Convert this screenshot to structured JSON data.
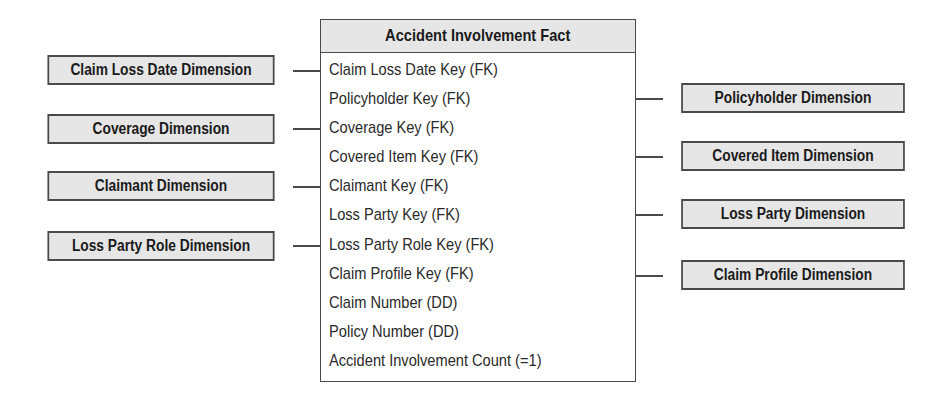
{
  "fact_table": {
    "title": "Accident Involvement Fact",
    "columns": [
      "Claim Loss Date Key (FK)",
      "Policyholder Key (FK)",
      "Coverage Key (FK)",
      "Covered Item Key (FK)",
      "Claimant Key (FK)",
      "Loss Party Key (FK)",
      "Loss Party Role Key (FK)",
      "Claim Profile Key (FK)",
      "Claim Number (DD)",
      "Policy Number (DD)",
      "Accident Involvement Count (=1)"
    ]
  },
  "left_dimensions": [
    {
      "label": "Claim Loss Date Dimension",
      "links_to": "Claim Loss Date Key (FK)"
    },
    {
      "label": "Coverage Dimension",
      "links_to": "Coverage Key (FK)"
    },
    {
      "label": "Claimant Dimension",
      "links_to": "Claimant Key (FK)"
    },
    {
      "label": "Loss Party Role Dimension",
      "links_to": "Loss Party Role Key (FK)"
    }
  ],
  "right_dimensions": [
    {
      "label": "Policyholder Dimension",
      "links_to": "Policyholder Key (FK)"
    },
    {
      "label": "Covered Item Dimension",
      "links_to": "Covered Item Key (FK)"
    },
    {
      "label": "Loss Party Dimension",
      "links_to": "Loss Party Key (FK)"
    },
    {
      "label": "Claim Profile Dimension",
      "links_to": "Claim Profile Key (FK)"
    }
  ],
  "colors": {
    "box_fill": "#e6e6e6",
    "border": "#4a4a4a",
    "text": "#1a1a1a"
  }
}
